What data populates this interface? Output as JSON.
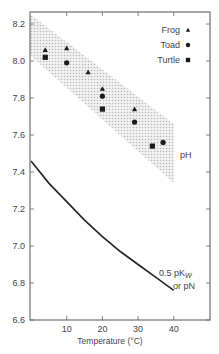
{
  "chart_data": {
    "type": "scatter",
    "title": "",
    "xlabel": "Temperature (°C)",
    "ylabel": "",
    "xlim": [
      0,
      50
    ],
    "ylim": [
      6.6,
      8.27
    ],
    "x_ticks": [
      10,
      20,
      30,
      40
    ],
    "x_tick_labels": [
      "10",
      "20",
      "30",
      "40"
    ],
    "y_ticks": [
      6.6,
      6.8,
      7.0,
      7.2,
      7.4,
      7.6,
      7.8,
      8.0,
      8.2
    ],
    "y_tick_labels": [
      "6.6",
      "6.8",
      "7.0",
      "7.2",
      "7.4",
      "7.6",
      "7.8",
      "8.0",
      "8.2"
    ],
    "grid": false,
    "legend_position": "upper right",
    "series": [
      {
        "name": "Frog",
        "marker": "triangle",
        "x": [
          4,
          10,
          16,
          20,
          29
        ],
        "y": [
          8.06,
          8.07,
          7.94,
          7.85,
          7.74
        ]
      },
      {
        "name": "Toad",
        "marker": "circle",
        "x": [
          10,
          20,
          29,
          37
        ],
        "y": [
          7.99,
          7.81,
          7.67,
          7.56
        ]
      },
      {
        "name": "Turtle",
        "marker": "square",
        "x": [
          4,
          20,
          34
        ],
        "y": [
          8.02,
          7.74,
          7.54
        ]
      }
    ],
    "band": {
      "label": "pH",
      "x": [
        0,
        40
      ],
      "upper": [
        8.27,
        7.66
      ],
      "lower": [
        8.05,
        7.34
      ],
      "fill": "stippled gray"
    },
    "curve": {
      "label_line1": "0.5 pK",
      "label_sub": "W",
      "label_line2": "or pN",
      "x": [
        0,
        5,
        10,
        15,
        20,
        25,
        30,
        35,
        40
      ],
      "y": [
        7.46,
        7.34,
        7.24,
        7.14,
        7.05,
        6.97,
        6.9,
        6.83,
        6.76
      ]
    },
    "annotations": [
      "pH",
      "0.5 pKW or pN"
    ]
  },
  "legend": {
    "items": [
      {
        "label": "Frog",
        "marker": "triangle"
      },
      {
        "label": "Toad",
        "marker": "circle"
      },
      {
        "label": "Turtle",
        "marker": "square"
      }
    ]
  },
  "labels": {
    "xlabel": "Temperature (°C)",
    "band": "pH",
    "curve_line1": "0.5 pK",
    "curve_sub": "W",
    "curve_line2": "or pN"
  }
}
